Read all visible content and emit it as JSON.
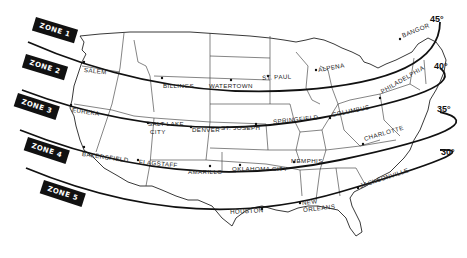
{
  "map": {
    "title": "",
    "zones": [
      {
        "id": 1,
        "label": "ZONE 1"
      },
      {
        "id": 2,
        "label": "ZONE 2"
      },
      {
        "id": 3,
        "label": "ZONE 3"
      },
      {
        "id": 4,
        "label": "ZONE 4"
      },
      {
        "id": 5,
        "label": "ZONE 5"
      }
    ],
    "latitudes": [
      {
        "label": "45°"
      },
      {
        "label": "40°"
      },
      {
        "label": "35°"
      },
      {
        "label": "30°"
      }
    ],
    "cities": {
      "salem": "SALEM",
      "billings": "BILLINGS",
      "watertown": "WATERTOWN",
      "st_paul": "ST. PAUL",
      "alpena": "ALPENA",
      "bangor": "BANGOR",
      "eureka": "EUREKA",
      "salt_lake": "SALT LAKE",
      "salt_lake_city": "CITY",
      "denver": "DENVER",
      "st_joseph": "ST. JOSEPH",
      "springfield": "SPRINGFIELD",
      "columbus": "COLUMBUS",
      "philadelphia": "PHILADELPHIA",
      "bakersfield": "BAKERSFIELD",
      "flagstaff": "FLAGSTAFF",
      "amarillo": "AMARILLO",
      "oklahoma_city": "OKLAHOMA CITY",
      "memphis": "MEMPHIS",
      "charlotte": "CHARLOTTE",
      "houston": "HOUSTON",
      "new": "NEW",
      "orleans": "ORLEANS",
      "jacksonville": "JACKSONVILLE"
    },
    "colors": {
      "ink": "#111111",
      "background": "#ffffff"
    }
  }
}
